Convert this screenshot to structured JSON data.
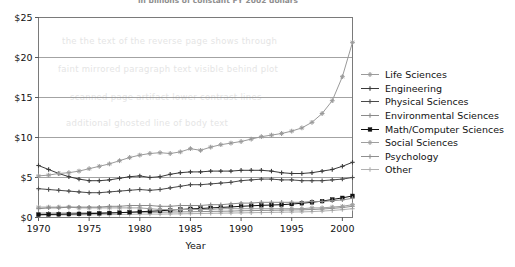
{
  "figure": {
    "clipped_title": "in billions of constant FY 2002 dollars",
    "bleed_through_lines": [
      "the the text of the reverse page shows through",
      "faint mirrored paragraph text visible behind plot",
      "scanned page artifact lower contrast lines",
      "additional ghosted line of body text"
    ]
  },
  "chart_data": {
    "type": "line",
    "title": "in billions of constant FY 2002 dollars",
    "xlabel": "Year",
    "ylabel": "",
    "xlim": [
      1970,
      2001
    ],
    "ylim": [
      0,
      25
    ],
    "ytick_values": [
      0,
      5,
      10,
      15,
      20,
      25
    ],
    "ytick_labels": [
      "$0",
      "$5",
      "$10",
      "$15",
      "$20",
      "$25"
    ],
    "xtick_values": [
      1970,
      1975,
      1980,
      1985,
      1990,
      1995,
      2000
    ],
    "xtick_labels": [
      "1970",
      "1975",
      "1980",
      "1985",
      "1990",
      "1995",
      "2000"
    ],
    "grid": "horizontal",
    "legend_position": "right",
    "x": [
      1970,
      1971,
      1972,
      1973,
      1974,
      1975,
      1976,
      1977,
      1978,
      1979,
      1980,
      1981,
      1982,
      1983,
      1984,
      1985,
      1986,
      1987,
      1988,
      1989,
      1990,
      1991,
      1992,
      1993,
      1994,
      1995,
      1996,
      1997,
      1998,
      1999,
      2000,
      2001
    ],
    "series": [
      {
        "name": "Life Sciences",
        "color": "#9a9a9a",
        "marker": "star",
        "values": [
          5.2,
          5.3,
          5.5,
          5.6,
          5.8,
          6.1,
          6.4,
          6.7,
          7.1,
          7.5,
          7.8,
          8.0,
          8.1,
          8.0,
          8.2,
          8.6,
          8.4,
          8.8,
          9.1,
          9.3,
          9.5,
          9.8,
          10.1,
          10.3,
          10.5,
          10.8,
          11.2,
          11.9,
          13.0,
          14.6,
          17.6,
          21.9
        ]
      },
      {
        "name": "Engineering",
        "color": "#3a3a3a",
        "marker": "plus",
        "values": [
          6.5,
          6.0,
          5.5,
          5.1,
          4.8,
          4.6,
          4.6,
          4.7,
          4.9,
          5.1,
          5.2,
          5.0,
          5.1,
          5.4,
          5.6,
          5.7,
          5.7,
          5.8,
          5.8,
          5.8,
          5.9,
          5.9,
          5.9,
          5.8,
          5.6,
          5.5,
          5.5,
          5.6,
          5.8,
          6.0,
          6.4,
          6.9
        ]
      },
      {
        "name": "Physical Sciences",
        "color": "#4a4a4a",
        "marker": "plus",
        "values": [
          3.6,
          3.5,
          3.4,
          3.3,
          3.2,
          3.1,
          3.1,
          3.2,
          3.3,
          3.4,
          3.5,
          3.4,
          3.5,
          3.7,
          3.9,
          4.1,
          4.1,
          4.2,
          4.3,
          4.4,
          4.6,
          4.7,
          4.8,
          4.8,
          4.7,
          4.7,
          4.6,
          4.6,
          4.6,
          4.7,
          4.8,
          5.0
        ]
      },
      {
        "name": "Environmental Sciences",
        "color": "#8a8a8a",
        "marker": "plus",
        "values": [
          1.1,
          1.2,
          1.2,
          1.3,
          1.3,
          1.3,
          1.3,
          1.4,
          1.4,
          1.5,
          1.5,
          1.5,
          1.4,
          1.4,
          1.5,
          1.5,
          1.5,
          1.6,
          1.6,
          1.7,
          1.8,
          1.8,
          1.9,
          1.9,
          1.9,
          1.9,
          1.9,
          2.0,
          2.0,
          2.1,
          2.2,
          2.4
        ]
      },
      {
        "name": "Math/Computer Sciences",
        "color": "#111111",
        "marker": "square",
        "values": [
          0.35,
          0.38,
          0.4,
          0.42,
          0.45,
          0.48,
          0.52,
          0.56,
          0.6,
          0.66,
          0.72,
          0.78,
          0.84,
          0.92,
          1.0,
          1.08,
          1.12,
          1.2,
          1.26,
          1.32,
          1.4,
          1.46,
          1.52,
          1.56,
          1.6,
          1.68,
          1.78,
          1.9,
          2.05,
          2.25,
          2.45,
          2.7
        ]
      },
      {
        "name": "Social Sciences",
        "color": "#9e9e9e",
        "marker": "star",
        "values": [
          1.3,
          1.3,
          1.3,
          1.3,
          1.2,
          1.2,
          1.2,
          1.2,
          1.2,
          1.2,
          1.2,
          1.1,
          1.0,
          1.0,
          1.0,
          1.0,
          1.0,
          1.0,
          1.1,
          1.1,
          1.1,
          1.1,
          1.1,
          1.1,
          1.1,
          1.1,
          1.1,
          1.2,
          1.2,
          1.3,
          1.4,
          1.6
        ]
      },
      {
        "name": "Psychology",
        "color": "#8f8f8f",
        "marker": "plus",
        "values": [
          0.55,
          0.55,
          0.56,
          0.56,
          0.57,
          0.58,
          0.58,
          0.6,
          0.62,
          0.64,
          0.66,
          0.66,
          0.66,
          0.68,
          0.7,
          0.72,
          0.74,
          0.76,
          0.78,
          0.8,
          0.84,
          0.86,
          0.88,
          0.9,
          0.92,
          0.94,
          0.96,
          1.0,
          1.06,
          1.14,
          1.24,
          1.4
        ]
      },
      {
        "name": "Other",
        "color": "#b0b0b0",
        "marker": "plus",
        "values": [
          0.3,
          0.3,
          0.31,
          0.32,
          0.33,
          0.34,
          0.35,
          0.36,
          0.38,
          0.4,
          0.42,
          0.42,
          0.42,
          0.44,
          0.46,
          0.48,
          0.5,
          0.52,
          0.54,
          0.56,
          0.58,
          0.6,
          0.62,
          0.64,
          0.66,
          0.68,
          0.7,
          0.74,
          0.8,
          0.88,
          0.98,
          1.1
        ]
      }
    ]
  }
}
